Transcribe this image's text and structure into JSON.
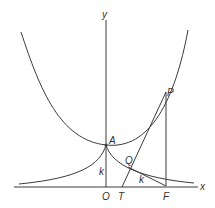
{
  "diagram": {
    "type": "catenary-tractrix",
    "axes": {
      "x_label": "x",
      "y_label": "y"
    },
    "points": {
      "A": "A",
      "P": "P",
      "Q": "Q",
      "O": "O",
      "T": "T",
      "F": "F"
    },
    "segment_labels": {
      "OA": "k",
      "QF": "k"
    },
    "colors": {
      "stroke": "#3a3a3a",
      "background": "#ffffff"
    }
  }
}
